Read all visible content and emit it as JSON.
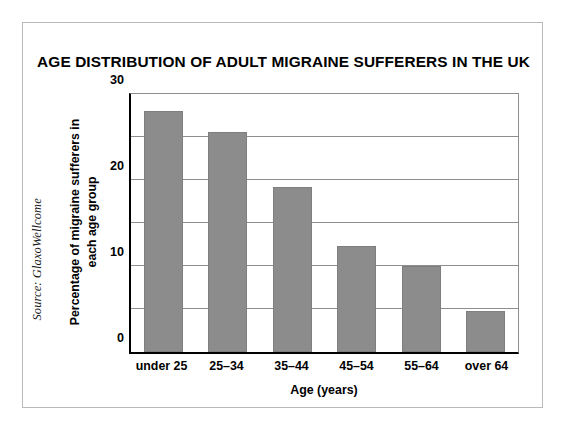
{
  "source_credit": "Source: GlaxoWellcome",
  "chart_data": {
    "type": "bar",
    "title": "AGE DISTRIBUTION OF ADULT MIGRAINE SUFFERERS IN THE UK",
    "xlabel": "Age (years)",
    "ylabel": "Percentage of migraine sufferers in each age group",
    "ylabel_lines": [
      "Percentage of migraine sufferers in",
      "each age group"
    ],
    "categories": [
      "under 25",
      "25–34",
      "35–44",
      "45–54",
      "55–64",
      "over 64"
    ],
    "values": [
      28.0,
      25.6,
      19.2,
      12.3,
      10.0,
      4.8
    ],
    "ylim": [
      0,
      30
    ],
    "yticks": [
      0,
      10,
      20,
      30
    ],
    "ytick_labels": [
      "0",
      "10",
      "20",
      "30"
    ],
    "gridlines": [
      5,
      10,
      15,
      20,
      25,
      30
    ],
    "grid": true,
    "legend": "none",
    "bar_color": "#8c8c8c",
    "axis_color": "#000000",
    "grid_color": "#8e8e8e",
    "frame_color": "#b9b9b9",
    "background": "#ffffff"
  }
}
